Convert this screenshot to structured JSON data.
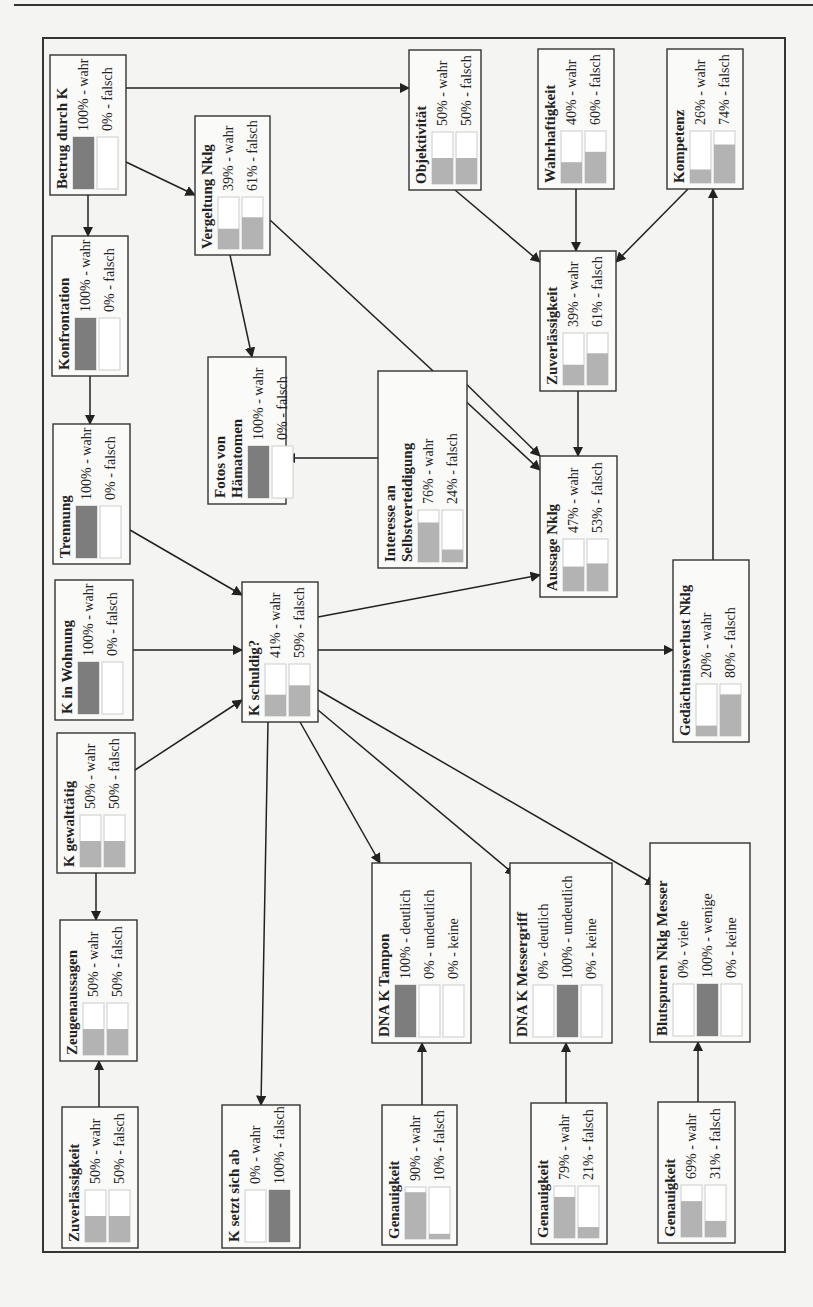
{
  "diagram": {
    "type": "bayesian-network",
    "orientation": "rotated-90-ccw",
    "frame": {
      "x": 43,
      "y": 38,
      "w": 742,
      "h": 1214
    },
    "colors": {
      "bar_full": "#7d7d7d",
      "bar_partial": "#b3b3b3",
      "bar_empty": "#ffffff",
      "box_border": "#333333",
      "edge": "#222222"
    },
    "nodes": [
      {
        "id": "betrug",
        "x": 50,
        "y": 55,
        "w": 76,
        "h": 140,
        "title": [
          "Betrug durch K"
        ],
        "states": [
          {
            "label": "100% - wahr",
            "p": 100
          },
          {
            "label": "0% - falsch",
            "p": 0
          }
        ]
      },
      {
        "id": "vergeltung",
        "x": 195,
        "y": 116,
        "w": 75,
        "h": 139,
        "title": [
          "Vergeltung Nklg"
        ],
        "states": [
          {
            "label": "39% - wahr",
            "p": 39
          },
          {
            "label": "61% - falsch",
            "p": 61
          }
        ]
      },
      {
        "id": "objektivitaet",
        "x": 409,
        "y": 50,
        "w": 72,
        "h": 140,
        "title": [
          "Objektivität"
        ],
        "states": [
          {
            "label": "50% - wahr",
            "p": 50
          },
          {
            "label": "50% - falsch",
            "p": 50
          }
        ]
      },
      {
        "id": "wahrhaftigkeit",
        "x": 538,
        "y": 49,
        "w": 76,
        "h": 140,
        "title": [
          "Wahrhaftigkeit"
        ],
        "states": [
          {
            "label": "40% - wahr",
            "p": 40
          },
          {
            "label": "60% - falsch",
            "p": 60
          }
        ]
      },
      {
        "id": "kompetenz",
        "x": 667,
        "y": 49,
        "w": 76,
        "h": 140,
        "title": [
          "Kompetenz"
        ],
        "states": [
          {
            "label": "26% - wahr",
            "p": 26
          },
          {
            "label": "74% - falsch",
            "p": 74
          }
        ]
      },
      {
        "id": "konfrontation",
        "x": 52,
        "y": 236,
        "w": 76,
        "h": 140,
        "title": [
          "Konfrontation"
        ],
        "states": [
          {
            "label": "100% - wahr",
            "p": 100
          },
          {
            "label": "0% - falsch",
            "p": 0
          }
        ]
      },
      {
        "id": "zuverlaessigkeit_r",
        "x": 540,
        "y": 251,
        "w": 76,
        "h": 140,
        "title": [
          "Zuverlässigkeit"
        ],
        "states": [
          {
            "label": "39% - wahr",
            "p": 39
          },
          {
            "label": "61% - falsch",
            "p": 61
          }
        ]
      },
      {
        "id": "fotos",
        "x": 208,
        "y": 357,
        "w": 78,
        "h": 147,
        "title": [
          "Fotos von",
          "Hämatomen"
        ],
        "states": [
          {
            "label": "100% - wahr",
            "p": 100
          },
          {
            "label": "0% - falsch",
            "p": 0
          }
        ]
      },
      {
        "id": "interesse",
        "x": 378,
        "y": 371,
        "w": 89,
        "h": 197,
        "title": [
          "Interesse an",
          "Selbstverteidigung"
        ],
        "states": [
          {
            "label": "76% - wahr",
            "p": 76
          },
          {
            "label": "24% - falsch",
            "p": 24
          }
        ]
      },
      {
        "id": "trennung",
        "x": 53,
        "y": 424,
        "w": 77,
        "h": 140,
        "title": [
          "Trennung"
        ],
        "states": [
          {
            "label": "100% - wahr",
            "p": 100
          },
          {
            "label": "0% - falsch",
            "p": 0
          }
        ]
      },
      {
        "id": "aussage",
        "x": 540,
        "y": 456,
        "w": 77,
        "h": 141,
        "title": [
          "Aussage Nklg"
        ],
        "states": [
          {
            "label": "47% - wahr",
            "p": 47
          },
          {
            "label": "53% - falsch",
            "p": 53
          }
        ]
      },
      {
        "id": "wohnung",
        "x": 55,
        "y": 580,
        "w": 78,
        "h": 140,
        "title": [
          "K in Wohnung"
        ],
        "states": [
          {
            "label": "100% - wahr",
            "p": 100
          },
          {
            "label": "0% - falsch",
            "p": 0
          }
        ]
      },
      {
        "id": "schuldig",
        "x": 242,
        "y": 582,
        "w": 76,
        "h": 140,
        "title": [
          "K schuldig?"
        ],
        "states": [
          {
            "label": "41% - wahr",
            "p": 41
          },
          {
            "label": "59% - falsch",
            "p": 59
          }
        ]
      },
      {
        "id": "gedaechtnis",
        "x": 673,
        "y": 560,
        "w": 76,
        "h": 182,
        "title": [
          "Gedächtnisverlust Nklg"
        ],
        "states": [
          {
            "label": "20% - wahr",
            "p": 20
          },
          {
            "label": "80% - falsch",
            "p": 80
          }
        ]
      },
      {
        "id": "gewalttaetig",
        "x": 57,
        "y": 733,
        "w": 78,
        "h": 140,
        "title": [
          "K gewalttätig"
        ],
        "states": [
          {
            "label": "50% - wahr",
            "p": 50
          },
          {
            "label": "50% - falsch",
            "p": 50
          }
        ]
      },
      {
        "id": "zeugen",
        "x": 60,
        "y": 920,
        "w": 77,
        "h": 141,
        "title": [
          "Zeugenaussagen"
        ],
        "states": [
          {
            "label": "50% - wahr",
            "p": 50
          },
          {
            "label": "50% - falsch",
            "p": 50
          }
        ]
      },
      {
        "id": "dna_tampon",
        "x": 372,
        "y": 863,
        "w": 99,
        "h": 180,
        "title": [
          "DNA K Tampon"
        ],
        "states": [
          {
            "label": "100% - deutlich",
            "p": 100
          },
          {
            "label": "0% - undeutlich",
            "p": 0
          },
          {
            "label": "0% - keine",
            "p": 0
          }
        ]
      },
      {
        "id": "dna_messer",
        "x": 510,
        "y": 863,
        "w": 102,
        "h": 180,
        "title": [
          "DNA K Messergriff"
        ],
        "states": [
          {
            "label": "0% - deutlich",
            "p": 0
          },
          {
            "label": "100% - undeutlich",
            "p": 100
          },
          {
            "label": "0% - keine",
            "p": 0
          }
        ]
      },
      {
        "id": "blutspuren",
        "x": 650,
        "y": 843,
        "w": 100,
        "h": 199,
        "title": [
          "Blutspuren Nklg Messer"
        ],
        "states": [
          {
            "label": "0% - viele",
            "p": 0
          },
          {
            "label": "100% - wenige",
            "p": 100
          },
          {
            "label": "0% - keine",
            "p": 0
          }
        ]
      },
      {
        "id": "zuverlaessigkeit_l",
        "x": 62,
        "y": 1107,
        "w": 76,
        "h": 141,
        "title": [
          "Zuverlässigkeit"
        ],
        "states": [
          {
            "label": "50% - wahr",
            "p": 50
          },
          {
            "label": "50% - falsch",
            "p": 50
          }
        ]
      },
      {
        "id": "absetzen",
        "x": 222,
        "y": 1105,
        "w": 78,
        "h": 143,
        "title": [
          "K setzt sich ab"
        ],
        "states": [
          {
            "label": "0% - wahr",
            "p": 0
          },
          {
            "label": "100% - falsch",
            "p": 100
          }
        ]
      },
      {
        "id": "genauigkeit1",
        "x": 382,
        "y": 1105,
        "w": 75,
        "h": 140,
        "title": [
          "Genauigkeit"
        ],
        "states": [
          {
            "label": "90% - wahr",
            "p": 90
          },
          {
            "label": "10% - falsch",
            "p": 10
          }
        ]
      },
      {
        "id": "genauigkeit2",
        "x": 531,
        "y": 1103,
        "w": 76,
        "h": 141,
        "title": [
          "Genauigkeit"
        ],
        "states": [
          {
            "label": "79% - wahr",
            "p": 79
          },
          {
            "label": "21% - falsch",
            "p": 21
          }
        ]
      },
      {
        "id": "genauigkeit3",
        "x": 658,
        "y": 1102,
        "w": 77,
        "h": 141,
        "title": [
          "Genauigkeit"
        ],
        "states": [
          {
            "label": "69% - wahr",
            "p": 69
          },
          {
            "label": "31% - falsch",
            "p": 31
          }
        ]
      }
    ],
    "edges": [
      {
        "from": "betrug",
        "to": "konfrontation",
        "path": [
          [
            88,
            195
          ],
          [
            88,
            236
          ]
        ]
      },
      {
        "from": "betrug",
        "to": "vergeltung",
        "path": [
          [
            126,
            162
          ],
          [
            195,
            195
          ]
        ]
      },
      {
        "from": "betrug",
        "to": "objektivitaet",
        "path": [
          [
            126,
            88
          ],
          [
            409,
            88
          ]
        ]
      },
      {
        "from": "konfrontation",
        "to": "trennung",
        "path": [
          [
            90,
            376
          ],
          [
            90,
            424
          ]
        ]
      },
      {
        "from": "vergeltung",
        "to": "fotos",
        "path": [
          [
            230,
            255
          ],
          [
            252,
            357
          ]
        ]
      },
      {
        "from": "vergeltung",
        "to": "aussage",
        "path": [
          [
            270,
            220
          ],
          [
            540,
            470
          ]
        ]
      },
      {
        "from": "objektivitaet",
        "to": "zuverlaessigkeit_r",
        "path": [
          [
            455,
            190
          ],
          [
            540,
            262
          ]
        ]
      },
      {
        "from": "wahrhaftigkeit",
        "to": "zuverlaessigkeit_r",
        "path": [
          [
            576,
            189
          ],
          [
            576,
            251
          ]
        ]
      },
      {
        "from": "kompetenz",
        "to": "zuverlaessigkeit_r",
        "path": [
          [
            688,
            189
          ],
          [
            616,
            262
          ]
        ]
      },
      {
        "from": "zuverlaessigkeit_r",
        "to": "aussage",
        "path": [
          [
            578,
            391
          ],
          [
            578,
            456
          ]
        ]
      },
      {
        "from": "interesse",
        "to": "fotos",
        "path": [
          [
            378,
            458
          ],
          [
            286,
            458
          ]
        ]
      },
      {
        "from": "interesse",
        "to": "aussage",
        "path": [
          [
            453,
            371
          ],
          [
            540,
            456
          ]
        ]
      },
      {
        "from": "trennung",
        "to": "schuldig",
        "path": [
          [
            130,
            530
          ],
          [
            242,
            595
          ]
        ]
      },
      {
        "from": "wohnung",
        "to": "schuldig",
        "path": [
          [
            133,
            650
          ],
          [
            242,
            650
          ]
        ]
      },
      {
        "from": "gewalttaetig",
        "to": "schuldig",
        "path": [
          [
            135,
            770
          ],
          [
            242,
            700
          ]
        ]
      },
      {
        "from": "gewalttaetig",
        "to": "zeugen",
        "path": [
          [
            96,
            873
          ],
          [
            96,
            920
          ]
        ]
      },
      {
        "from": "schuldig",
        "to": "aussage",
        "path": [
          [
            318,
            617
          ],
          [
            540,
            575
          ]
        ]
      },
      {
        "from": "schuldig",
        "to": "gedaechtnis",
        "path": [
          [
            318,
            650
          ],
          [
            673,
            650
          ]
        ]
      },
      {
        "from": "schuldig",
        "to": "dna_tampon",
        "path": [
          [
            300,
            722
          ],
          [
            380,
            863
          ]
        ]
      },
      {
        "from": "schuldig",
        "to": "dna_messer",
        "path": [
          [
            318,
            710
          ],
          [
            515,
            875
          ]
        ]
      },
      {
        "from": "schuldig",
        "to": "blutspuren",
        "path": [
          [
            318,
            690
          ],
          [
            655,
            885
          ]
        ]
      },
      {
        "from": "schuldig",
        "to": "absetzen",
        "path": [
          [
            268,
            722
          ],
          [
            261,
            1105
          ]
        ]
      },
      {
        "from": "gedaechtnis",
        "to": "kompetenz",
        "path": [
          [
            713,
            560
          ],
          [
            713,
            189
          ]
        ]
      },
      {
        "from": "zuverlaessigkeit_l",
        "to": "zeugen",
        "path": [
          [
            99,
            1107
          ],
          [
            99,
            1061
          ]
        ]
      },
      {
        "from": "genauigkeit1",
        "to": "dna_tampon",
        "path": [
          [
            422,
            1105
          ],
          [
            422,
            1043
          ]
        ]
      },
      {
        "from": "genauigkeit2",
        "to": "dna_messer",
        "path": [
          [
            566,
            1103
          ],
          [
            566,
            1043
          ]
        ]
      },
      {
        "from": "genauigkeit3",
        "to": "blutspuren",
        "path": [
          [
            698,
            1102
          ],
          [
            698,
            1042
          ]
        ]
      }
    ]
  }
}
